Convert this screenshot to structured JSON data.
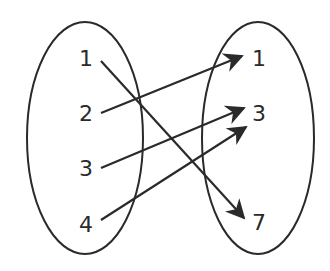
{
  "diagram": {
    "type": "mapping",
    "domain_set": {
      "elements": [
        "1",
        "2",
        "3",
        "4"
      ]
    },
    "range_set": {
      "elements": [
        "1",
        "3",
        "7"
      ]
    },
    "mappings": [
      {
        "from": "1",
        "to": "7"
      },
      {
        "from": "2",
        "to": "1"
      },
      {
        "from": "3",
        "to": "3"
      },
      {
        "from": "4",
        "to": "3"
      }
    ],
    "colors": {
      "stroke": "#2a2a2a",
      "background": "#ffffff"
    }
  }
}
